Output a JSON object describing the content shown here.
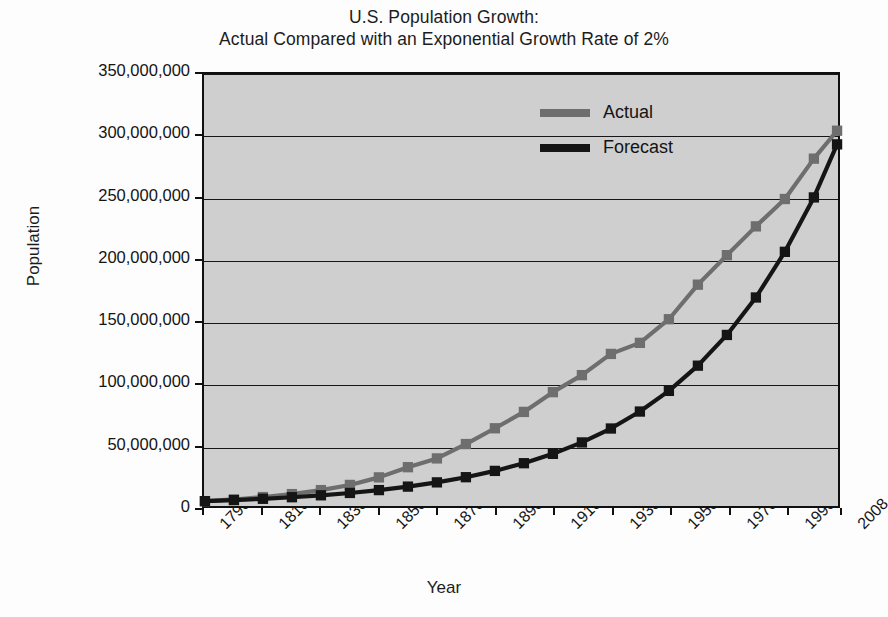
{
  "chart_data": {
    "type": "line",
    "title": "U.S. Population Growth: Actual Compared with an Exponential Growth Rate of 2%",
    "title_lines": [
      "U.S. Population Growth:",
      "Actual Compared with an Exponential Growth Rate of 2%"
    ],
    "xlabel": "Year",
    "ylabel": "Population",
    "ylim": [
      0,
      350000000
    ],
    "ytick_values": [
      0,
      50000000,
      100000000,
      150000000,
      200000000,
      250000000,
      300000000,
      350000000
    ],
    "ytick_labels": [
      "0",
      "50,000,000",
      "100,000,000",
      "150,000,000",
      "200,000,000",
      "250,000,000",
      "300,000,000",
      "350,000,000"
    ],
    "grid": true,
    "legend_position": "upper right",
    "x": [
      1790,
      1800,
      1810,
      1820,
      1830,
      1840,
      1850,
      1860,
      1870,
      1880,
      1890,
      1900,
      1910,
      1920,
      1930,
      1940,
      1950,
      1960,
      1970,
      1980,
      1990,
      2000,
      2008
    ],
    "xtick_labels": [
      "1790",
      "1810",
      "1830",
      "1850",
      "1870",
      "1890",
      "1910",
      "1930",
      "1950",
      "1970",
      "1990",
      "2008"
    ],
    "xtick_values": [
      1790,
      1810,
      1830,
      1850,
      1870,
      1890,
      1910,
      1930,
      1950,
      1970,
      1990,
      2008
    ],
    "series": [
      {
        "name": "Actual",
        "color": "#6e6e6e",
        "marker": "square",
        "values": [
          3929214,
          5308483,
          7239881,
          9638453,
          12866020,
          17069453,
          23191876,
          31443321,
          38558371,
          50189209,
          62979766,
          76212168,
          92228496,
          106021537,
          123202624,
          132164569,
          151325798,
          179323175,
          203211926,
          226545805,
          248709873,
          281421906,
          304059724
        ]
      },
      {
        "name": "Forecast",
        "color": "#151515",
        "marker": "square",
        "values": [
          3929214,
          4789346,
          5837778,
          7115673,
          8673469,
          10572000,
          12885500,
          15705900,
          19143300,
          23334000,
          28441800,
          34667800,
          42257300,
          51508000,
          62783300,
          76524700,
          93275900,
          113696000,
          138588000,
          168932000,
          205922000,
          250013000,
          293000000
        ]
      }
    ]
  },
  "legend": {
    "items": [
      {
        "label": "Actual",
        "color": "#6e6e6e"
      },
      {
        "label": "Forecast",
        "color": "#151515"
      }
    ]
  },
  "colors": {
    "plot_background": "#cfcfcf",
    "page_background": "#fdfdfd",
    "axis": "#101010",
    "gridline": "#15151a",
    "actual": "#6e6e6e",
    "forecast": "#151515"
  }
}
